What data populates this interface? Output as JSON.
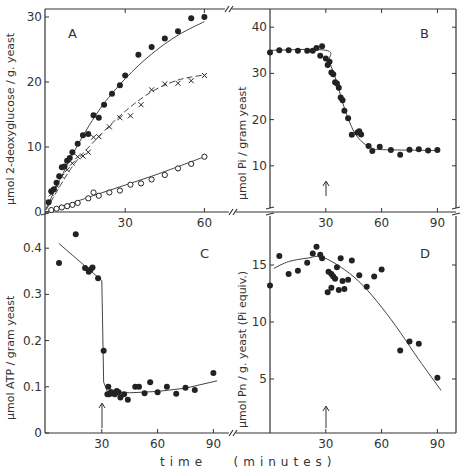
{
  "figure": {
    "x_axis_label": "time   (minutes)"
  },
  "chart_data": [
    {
      "panel": "A",
      "type": "scatter",
      "title": "A",
      "xlabel": "",
      "ylabel": "µmol 2-deoxyglucose / g. yeast",
      "xlim": [
        0,
        70
      ],
      "ylim": [
        0,
        30
      ],
      "xticks": [
        30,
        60
      ],
      "yticks": [
        0,
        10,
        20,
        30
      ],
      "grid": false,
      "series": [
        {
          "name": "filled circles",
          "marker": "filled-circle",
          "x": [
            1,
            2,
            3,
            4,
            5,
            6,
            7,
            8,
            9,
            10,
            12,
            14,
            16,
            18,
            20,
            22,
            25,
            28,
            30,
            35,
            40,
            45,
            50,
            55,
            60
          ],
          "y": [
            1.5,
            3.2,
            3.5,
            4.5,
            5.5,
            6.9,
            7.0,
            7.9,
            8.3,
            9.2,
            10.5,
            11.8,
            12,
            14.9,
            14.5,
            16.5,
            18.2,
            19.5,
            21,
            24.2,
            25.4,
            26.7,
            27.8,
            29.8,
            30
          ],
          "fit": [
            [
              0,
              0.5
            ],
            [
              10,
              8.8
            ],
            [
              20,
              15.6
            ],
            [
              30,
              20.5
            ],
            [
              40,
              24.3
            ],
            [
              50,
              27.2
            ],
            [
              60,
              29.3
            ]
          ]
        },
        {
          "name": "crosses",
          "marker": "x",
          "x": [
            2,
            4,
            6,
            8,
            10,
            12,
            14,
            16,
            18,
            20,
            24,
            28,
            32,
            36,
            40,
            45,
            50,
            55,
            60
          ],
          "y": [
            2.8,
            4.1,
            5.5,
            6.5,
            7.5,
            8.5,
            8.6,
            9.2,
            11.5,
            11.6,
            13.1,
            14.5,
            14.8,
            16.5,
            18.8,
            19.7,
            19.8,
            20.2,
            21
          ],
          "fit": [
            [
              0,
              0.3
            ],
            [
              10,
              7.0
            ],
            [
              20,
              11.6
            ],
            [
              30,
              15.5
            ],
            [
              40,
              18.5
            ],
            [
              50,
              20.3
            ],
            [
              60,
              21.1
            ]
          ]
        },
        {
          "name": "open circles",
          "marker": "open-circle",
          "x": [
            2,
            4,
            6,
            8,
            10,
            12,
            16,
            18,
            20,
            24,
            28,
            32,
            36,
            40,
            45,
            50,
            55,
            60
          ],
          "y": [
            0.3,
            0.5,
            0.7,
            0.9,
            1.1,
            1.4,
            2.1,
            3.0,
            2.5,
            3.0,
            3.3,
            4.2,
            4.4,
            5.0,
            5.7,
            6.7,
            7.4,
            8.5
          ],
          "fit": [
            [
              0,
              0
            ],
            [
              20,
              2.8
            ],
            [
              40,
              5.5
            ],
            [
              60,
              8.5
            ]
          ]
        }
      ]
    },
    {
      "panel": "B",
      "type": "scatter",
      "title": "B",
      "xlabel": "",
      "ylabel": "µmol Pi / gram yeast",
      "xlim": [
        0,
        100
      ],
      "ylim": [
        0,
        44
      ],
      "xticks": [
        30,
        60,
        90
      ],
      "yticks": [
        10,
        20,
        30,
        40
      ],
      "annotation": "arrow at 30 min",
      "grid": false,
      "series": [
        {
          "name": "Pi",
          "marker": "filled-circle",
          "x": [
            0,
            5,
            10,
            15,
            20,
            23,
            25,
            27,
            28,
            30,
            31,
            32,
            33,
            34,
            35,
            36,
            37,
            38,
            39,
            40,
            42,
            44,
            47,
            48,
            49,
            53,
            55,
            59,
            65,
            70,
            75,
            80,
            85,
            90
          ],
          "y": [
            34.5,
            35,
            35,
            34.9,
            34.9,
            34.9,
            35.5,
            33.8,
            35.9,
            33.2,
            31.8,
            32.5,
            30.2,
            29.8,
            28.1,
            27.8,
            26.9,
            24.8,
            24.2,
            21.9,
            20.3,
            16.7,
            17.2,
            17.5,
            16.8,
            14.3,
            13.2,
            14.1,
            13.4,
            12.4,
            13.5,
            13.6,
            13.3,
            13.4
          ],
          "fit": [
            [
              0,
              35
            ],
            [
              30,
              35
            ],
            [
              32,
              32.5
            ],
            [
              36,
              28
            ],
            [
              40,
              22.5
            ],
            [
              45,
              17.5
            ],
            [
              50,
              15
            ],
            [
              55,
              13.8
            ],
            [
              60,
              13.5
            ],
            [
              90,
              13.3
            ]
          ]
        }
      ]
    },
    {
      "panel": "C",
      "type": "scatter",
      "title": "C",
      "xlabel": "time (minutes)",
      "ylabel": "µmol ATP / gram yeast",
      "xlim": [
        0,
        100
      ],
      "ylim": [
        0,
        0.45
      ],
      "xticks": [
        30,
        60,
        90
      ],
      "yticks": [
        0,
        0.1,
        0.2,
        0.3,
        0.4
      ],
      "annotation": "arrow at 30 min",
      "grid": false,
      "series": [
        {
          "name": "ATP",
          "marker": "filled-circle",
          "x": [
            7,
            16,
            21,
            23,
            24,
            25,
            28,
            31,
            33,
            33.5,
            34,
            35,
            36,
            37,
            38,
            39,
            40,
            42,
            44,
            48,
            50,
            53,
            56,
            60,
            65,
            70,
            75,
            80,
            90
          ],
          "y": [
            0.368,
            0.43,
            0.357,
            0.349,
            0.354,
            0.358,
            0.335,
            0.178,
            0.084,
            0.1,
            0.084,
            0.089,
            0.086,
            0.084,
            0.091,
            0.088,
            0.077,
            0.084,
            0.072,
            0.1,
            0.1,
            0.086,
            0.11,
            0.088,
            0.1,
            0.085,
            0.098,
            0.093,
            0.13
          ],
          "fit": [
            [
              7,
              0.41
            ],
            [
              30,
              0.33
            ],
            [
              31,
              0.11
            ],
            [
              33,
              0.09
            ],
            [
              45,
              0.087
            ],
            [
              60,
              0.09
            ],
            [
              75,
              0.097
            ],
            [
              92,
              0.113
            ]
          ]
        }
      ]
    },
    {
      "panel": "D",
      "type": "scatter",
      "title": "D",
      "xlabel": "time (minutes)",
      "ylabel": "µmol Pn / g. yeast  (Pi equiv.)",
      "xlim": [
        0,
        100
      ],
      "ylim": [
        0,
        17.5
      ],
      "xticks": [
        30,
        60,
        90
      ],
      "yticks": [
        5,
        10,
        15
      ],
      "annotation": "arrow at 30 min",
      "grid": false,
      "series": [
        {
          "name": "Pn",
          "marker": "filled-circle",
          "x": [
            0,
            5,
            10,
            15,
            20,
            23,
            25,
            27,
            28,
            31,
            31.5,
            33,
            33,
            34,
            35,
            36,
            37,
            38,
            39,
            40,
            42,
            44,
            48,
            52,
            56,
            60,
            70,
            75,
            80,
            90
          ],
          "y": [
            13.2,
            15.8,
            14.2,
            14.5,
            15.2,
            16.0,
            16.6,
            15.9,
            15.6,
            12.6,
            14.4,
            14.2,
            13.0,
            14.0,
            13.8,
            14.8,
            12.8,
            15.6,
            13.6,
            12.9,
            13.7,
            15.4,
            14.1,
            13.1,
            14.0,
            14.6,
            7.5,
            8.3,
            8.1,
            5.1
          ],
          "fit": [
            [
              2,
              14.7
            ],
            [
              10,
              15.3
            ],
            [
              20,
              15.6
            ],
            [
              28,
              15.7
            ],
            [
              40,
              14.6
            ],
            [
              50,
              13.2
            ],
            [
              60,
              11.3
            ],
            [
              70,
              9.1
            ],
            [
              80,
              6.7
            ],
            [
              92,
              4.0
            ]
          ]
        }
      ]
    }
  ]
}
